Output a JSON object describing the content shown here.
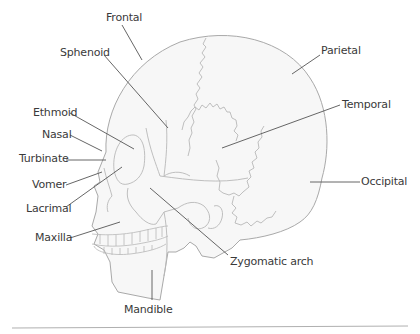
{
  "diagram": {
    "type": "skull-lateral-view",
    "colors": {
      "skull_fill": "#f7f7f7",
      "skull_outline": "#a9a9a9",
      "suture_line": "#b8b8b8",
      "leader_line": "#555555",
      "label_text": "#3a3a3a",
      "baseline": "#b0b0b0"
    },
    "labels": [
      {
        "id": "frontal",
        "text": "Frontal"
      },
      {
        "id": "sphenoid",
        "text": "Sphenoid"
      },
      {
        "id": "parietal",
        "text": "Parietal"
      },
      {
        "id": "temporal",
        "text": "Temporal"
      },
      {
        "id": "ethmoid",
        "text": "Ethmoid"
      },
      {
        "id": "nasal",
        "text": "Nasal"
      },
      {
        "id": "turbinate",
        "text": "Turbinate"
      },
      {
        "id": "vomer",
        "text": "Vomer"
      },
      {
        "id": "occipital",
        "text": "Occipital"
      },
      {
        "id": "lacrimal",
        "text": "Lacrimal"
      },
      {
        "id": "maxilla",
        "text": "Maxilla"
      },
      {
        "id": "zygomatic",
        "text": "Zygomatic arch"
      },
      {
        "id": "mandible",
        "text": "Mandible"
      }
    ]
  }
}
